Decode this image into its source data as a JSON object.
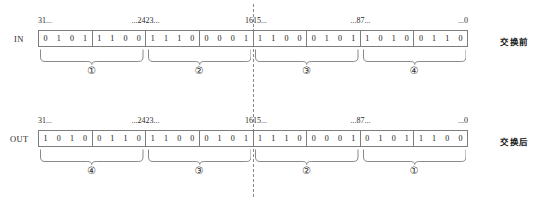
{
  "figure": {
    "divider_label": "byte-boundary-dashed-line"
  },
  "rows": [
    {
      "id": "in",
      "label": "IN",
      "note": "交换前",
      "ticks": [
        {
          "text": "31...",
          "align": "left",
          "pos": 0
        },
        {
          "text": "...24",
          "align": "right",
          "pos": 25
        },
        {
          "text": "23...",
          "align": "left",
          "pos": 25
        },
        {
          "text": "16",
          "align": "right",
          "pos": 50
        },
        {
          "text": "15...",
          "align": "left",
          "pos": 50
        },
        {
          "text": "...8",
          "align": "right",
          "pos": 75
        },
        {
          "text": "7...",
          "align": "left",
          "pos": 75
        },
        {
          "text": "...0",
          "align": "right",
          "pos": 100
        }
      ],
      "nibbles": [
        [
          "0",
          "1",
          "0",
          "1"
        ],
        [
          "1",
          "1",
          "0",
          "0"
        ],
        [
          "1",
          "1",
          "1",
          "0"
        ],
        [
          "0",
          "0",
          "0",
          "1"
        ],
        [
          "1",
          "1",
          "0",
          "0"
        ],
        [
          "0",
          "1",
          "0",
          "1"
        ],
        [
          "1",
          "0",
          "1",
          "0"
        ],
        [
          "0",
          "1",
          "1",
          "0"
        ]
      ],
      "groups": [
        {
          "circle": "①",
          "start": 0,
          "end": 25
        },
        {
          "circle": "②",
          "start": 25,
          "end": 50
        },
        {
          "circle": "③",
          "start": 50,
          "end": 75
        },
        {
          "circle": "④",
          "start": 75,
          "end": 100
        }
      ]
    },
    {
      "id": "out",
      "label": "OUT",
      "note": "交换后",
      "ticks": [
        {
          "text": "31...",
          "align": "left",
          "pos": 0
        },
        {
          "text": "...24",
          "align": "right",
          "pos": 25
        },
        {
          "text": "23...",
          "align": "left",
          "pos": 25
        },
        {
          "text": "16",
          "align": "right",
          "pos": 50
        },
        {
          "text": "15...",
          "align": "left",
          "pos": 50
        },
        {
          "text": "...8",
          "align": "right",
          "pos": 75
        },
        {
          "text": "7...",
          "align": "left",
          "pos": 75
        },
        {
          "text": "...0",
          "align": "right",
          "pos": 100
        }
      ],
      "nibbles": [
        [
          "1",
          "0",
          "1",
          "0"
        ],
        [
          "0",
          "1",
          "1",
          "0"
        ],
        [
          "1",
          "1",
          "0",
          "0"
        ],
        [
          "0",
          "1",
          "0",
          "1"
        ],
        [
          "1",
          "1",
          "1",
          "0"
        ],
        [
          "0",
          "0",
          "0",
          "1"
        ],
        [
          "0",
          "1",
          "0",
          "1"
        ],
        [
          "1",
          "1",
          "0",
          "0"
        ]
      ],
      "groups": [
        {
          "circle": "④",
          "start": 0,
          "end": 25
        },
        {
          "circle": "③",
          "start": 25,
          "end": 50
        },
        {
          "circle": "②",
          "start": 50,
          "end": 75
        },
        {
          "circle": "①",
          "start": 75,
          "end": 100
        }
      ]
    }
  ],
  "colors": {
    "line": "#7d7d7d",
    "dashed": "#8a8a8a",
    "text": "#1a1a1a",
    "background": "#ffffff"
  }
}
